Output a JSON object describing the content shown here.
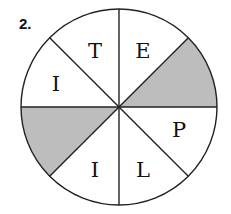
{
  "problem_number": "2.",
  "diagram": {
    "type": "spinner",
    "sections": 8,
    "colors": {
      "shaded": "#bdbdbd",
      "unshaded": "#ffffff",
      "stroke": "#222222"
    },
    "segments": [
      {
        "position": "top-right",
        "label": "E",
        "shaded": false
      },
      {
        "position": "right-upper",
        "label": "",
        "shaded": true
      },
      {
        "position": "right-lower",
        "label": "P",
        "shaded": false
      },
      {
        "position": "bottom-right",
        "label": "L",
        "shaded": false
      },
      {
        "position": "bottom-left",
        "label": "I",
        "shaded": false
      },
      {
        "position": "left-lower",
        "label": "",
        "shaded": true
      },
      {
        "position": "left-upper",
        "label": "I",
        "shaded": false
      },
      {
        "position": "top-left",
        "label": "T",
        "shaded": false
      }
    ]
  }
}
